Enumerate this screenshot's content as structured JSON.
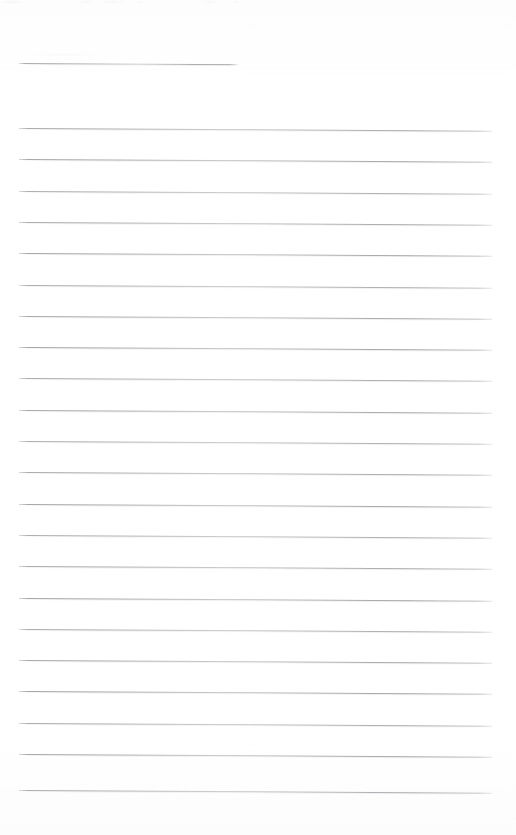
{
  "page": {
    "kind": "scanned-blank-lined-notebook-page",
    "width_px": 516,
    "height_px": 835,
    "background_color": "#ffffff",
    "rule_color": "#9a9ca0",
    "text_content": "",
    "note": "Blank ruled page - no written or printed text is present."
  },
  "rules": {
    "left_x": 19,
    "right_x": 492,
    "short_line_right_x": 238,
    "line_spacing_px": 31.3,
    "slant_deg": 0.32,
    "total_lines": 23,
    "lines": [
      {
        "index": 0,
        "y": 63,
        "x_start": 19,
        "x_end": 238,
        "variant": "short"
      },
      {
        "index": 1,
        "y": 128.0,
        "x_start": 19,
        "x_end": 492,
        "variant": "full"
      },
      {
        "index": 2,
        "y": 159.3,
        "x_start": 19,
        "x_end": 492,
        "variant": "full"
      },
      {
        "index": 3,
        "y": 190.6,
        "x_start": 19,
        "x_end": 492,
        "variant": "full"
      },
      {
        "index": 4,
        "y": 221.9,
        "x_start": 19,
        "x_end": 492,
        "variant": "full"
      },
      {
        "index": 5,
        "y": 253.2,
        "x_start": 19,
        "x_end": 492,
        "variant": "full"
      },
      {
        "index": 6,
        "y": 284.5,
        "x_start": 19,
        "x_end": 492,
        "variant": "full"
      },
      {
        "index": 7,
        "y": 315.8,
        "x_start": 19,
        "x_end": 492,
        "variant": "full"
      },
      {
        "index": 8,
        "y": 347.1,
        "x_start": 19,
        "x_end": 492,
        "variant": "full"
      },
      {
        "index": 9,
        "y": 378.4,
        "x_start": 19,
        "x_end": 492,
        "variant": "full"
      },
      {
        "index": 10,
        "y": 409.7,
        "x_start": 19,
        "x_end": 492,
        "variant": "full"
      },
      {
        "index": 11,
        "y": 441.0,
        "x_start": 19,
        "x_end": 492,
        "variant": "full"
      },
      {
        "index": 12,
        "y": 472.3,
        "x_start": 19,
        "x_end": 492,
        "variant": "full"
      },
      {
        "index": 13,
        "y": 503.6,
        "x_start": 19,
        "x_end": 492,
        "variant": "full"
      },
      {
        "index": 14,
        "y": 534.9,
        "x_start": 19,
        "x_end": 492,
        "variant": "full"
      },
      {
        "index": 15,
        "y": 566.2,
        "x_start": 19,
        "x_end": 492,
        "variant": "full"
      },
      {
        "index": 16,
        "y": 597.5,
        "x_start": 19,
        "x_end": 492,
        "variant": "full"
      },
      {
        "index": 17,
        "y": 628.8,
        "x_start": 19,
        "x_end": 492,
        "variant": "full"
      },
      {
        "index": 18,
        "y": 660.1,
        "x_start": 19,
        "x_end": 492,
        "variant": "full"
      },
      {
        "index": 19,
        "y": 691.4,
        "x_start": 19,
        "x_end": 492,
        "variant": "full"
      },
      {
        "index": 20,
        "y": 722.7,
        "x_start": 19,
        "x_end": 492,
        "variant": "full"
      },
      {
        "index": 21,
        "y": 754.0,
        "x_start": 19,
        "x_end": 492,
        "variant": "full"
      },
      {
        "index": 22,
        "y": 790.0,
        "x_start": 19,
        "x_end": 492,
        "variant": "full"
      }
    ]
  }
}
